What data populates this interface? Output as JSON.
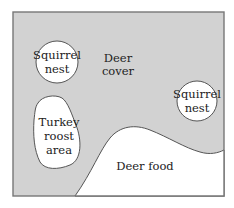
{
  "diagram": {
    "colors": {
      "cover": "#d2d2d2",
      "border": "#777777",
      "open": "#ffffff",
      "text": "#222222"
    },
    "regions": {
      "deer_cover": {
        "line1": "Deer",
        "line2": "cover"
      },
      "squirrel_nest_left": {
        "line1": "Squirrel",
        "line2": "nest"
      },
      "squirrel_nest_right": {
        "line1": "Squirrel",
        "line2": "nest"
      },
      "turkey_roost": {
        "line1": "Turkey",
        "line2": "roost",
        "line3": "area"
      },
      "deer_food": {
        "label": "Deer food"
      }
    }
  }
}
